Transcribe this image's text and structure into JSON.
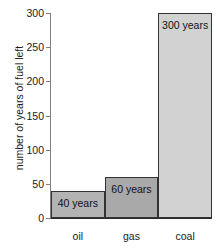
{
  "chart_data": {
    "type": "bar",
    "title": "",
    "xlabel": "",
    "ylabel": "number of years of fuel left",
    "categories": [
      "oil",
      "gas",
      "coal"
    ],
    "values": [
      40,
      60,
      300
    ],
    "data_labels": [
      "40 years",
      "60 years",
      "300 years"
    ],
    "ylim": [
      0,
      300
    ],
    "yticks": [
      0,
      50,
      100,
      150,
      200,
      250,
      300
    ],
    "ytick_labels": [
      "0",
      "50",
      "100",
      "150",
      "200",
      "250",
      "300"
    ],
    "grid": false,
    "legend": "none",
    "bar_colors": [
      "#b3b3b3",
      "#a9a9a9",
      "#d2d2d2"
    ],
    "bar_edge_color": "#333333",
    "axis_color": "#808080",
    "text_color": "#1a1a1a",
    "background": "#ffffff"
  }
}
